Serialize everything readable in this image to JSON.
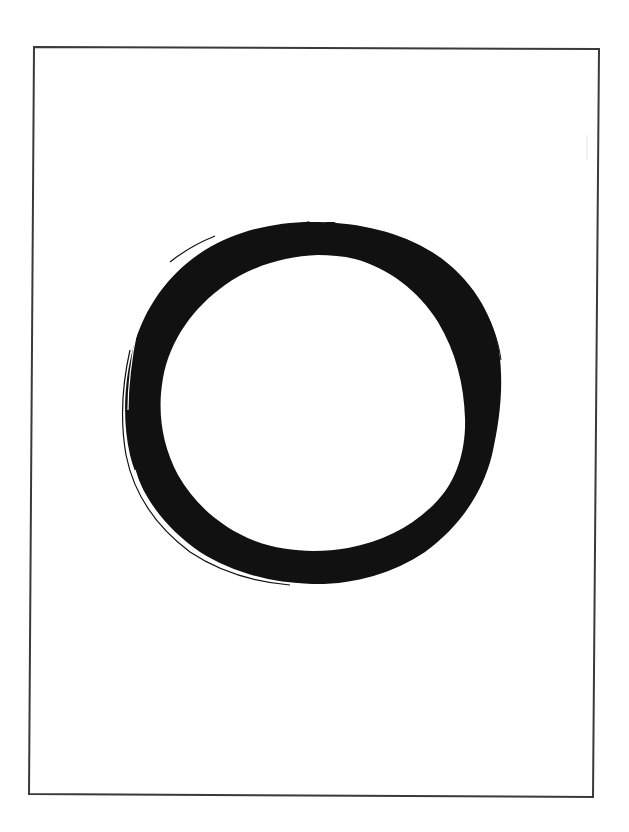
{
  "figure": {
    "frame": {
      "stroke_color": "#3a3a3a",
      "background": "#ffffff"
    },
    "ring": {
      "ink_color": "#111111"
    }
  }
}
